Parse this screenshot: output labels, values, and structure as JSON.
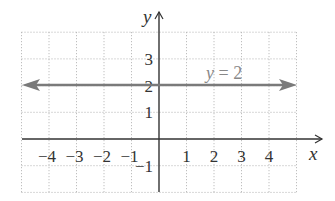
{
  "chart_data": {
    "type": "line",
    "title": "",
    "xlabel": "x",
    "ylabel": "y",
    "xlim": [
      -5,
      5
    ],
    "ylim": [
      -2,
      4
    ],
    "grid": true,
    "grid_style": "dotted",
    "x_ticks": [
      -4,
      -3,
      -2,
      -1,
      1,
      2,
      3,
      4
    ],
    "x_tick_labels": [
      "−4",
      "−3",
      "−2",
      "−1",
      "1",
      "2",
      "3",
      "4"
    ],
    "y_ticks": [
      -1,
      1,
      2,
      3
    ],
    "y_tick_labels": [
      "−1",
      "1",
      "2",
      "3"
    ],
    "series": [
      {
        "name": "y = 2",
        "equation": "y = 2",
        "x": [
          -5,
          5
        ],
        "values": [
          2,
          2
        ],
        "color": "#7a7a7a",
        "arrows": "both"
      }
    ],
    "annotations": [
      {
        "text": "y = 2",
        "x": 2.2,
        "y": 2.4
      }
    ],
    "legend": null
  },
  "labels": {
    "x_axis": "x",
    "y_axis": "y",
    "line_label": "y = 2",
    "x_ticks": [
      "−4",
      "−3",
      "−2",
      "−1",
      "1",
      "2",
      "3",
      "4"
    ],
    "y_ticks": [
      "3",
      "2",
      "1",
      "−1"
    ]
  },
  "colors": {
    "axis": "#333333",
    "grid": "#aaaaaa",
    "line": "#7a7a7a",
    "label": "#888888"
  }
}
